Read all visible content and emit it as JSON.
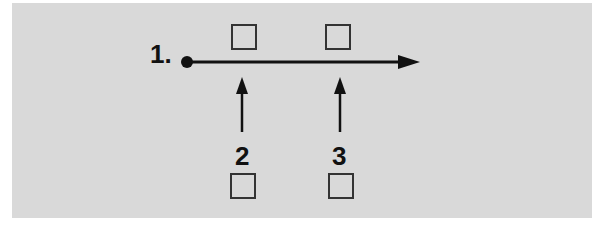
{
  "diagram": {
    "background_color": "#d9d9d9",
    "start_label": "1.",
    "labels": [
      {
        "id": "label-2",
        "text": "2"
      },
      {
        "id": "label-3",
        "text": "3"
      }
    ],
    "checkboxes": [
      {
        "id": "top-box-1",
        "checked": false
      },
      {
        "id": "top-box-2",
        "checked": false
      },
      {
        "id": "bottom-box-2",
        "checked": false
      },
      {
        "id": "bottom-box-3",
        "checked": false
      }
    ],
    "elements": [
      "timeline-arrow",
      "up-arrow-2",
      "up-arrow-3"
    ]
  }
}
